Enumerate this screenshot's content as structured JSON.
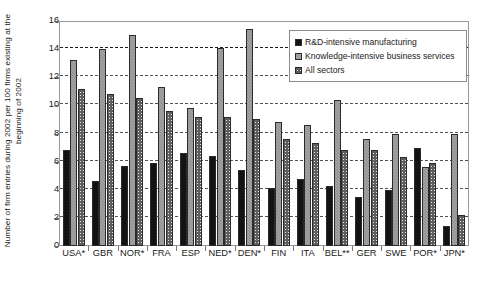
{
  "chart_data": {
    "type": "bar",
    "title": "",
    "subtitle": "",
    "xlabel": "",
    "ylabel": "Number of firm entries during 2002 per 100 firms existing at the beginning of 2002",
    "ylabel_lines": [
      "Number of firm entries during 2002 per 100 firms existing at the",
      "beginning of 2002"
    ],
    "ylim": [
      0,
      16
    ],
    "yticks": [
      0,
      2,
      4,
      6,
      8,
      10,
      12,
      14,
      16
    ],
    "ytick_labels": [
      "0",
      "2",
      "4",
      "6",
      "8",
      "10",
      "12",
      "14",
      "16"
    ],
    "grid": true,
    "grid_axis": "y",
    "legend_position": "top-right",
    "categories": [
      "USA*",
      "GBR",
      "NOR*",
      "FRA",
      "ESP",
      "NED*",
      "DEN*",
      "FIN",
      "ITA",
      "BEL**",
      "GER",
      "SWE",
      "POR*",
      "JPN*"
    ],
    "series": [
      {
        "name": "R&D-intensive manufacturing",
        "color": "#131313",
        "pattern": "solid-black",
        "values": [
          6.8,
          4.6,
          5.7,
          5.9,
          6.6,
          6.4,
          5.4,
          4.1,
          4.8,
          4.3,
          3.5,
          4.0,
          7.0,
          1.4
        ]
      },
      {
        "name": "Knowledge-intensive business services",
        "color": "#8c8c8c",
        "pattern": "solid-gray",
        "values": [
          13.2,
          14.0,
          15.0,
          11.3,
          9.8,
          14.1,
          15.4,
          8.8,
          8.6,
          10.4,
          7.6,
          8.0,
          5.6,
          8.0
        ]
      },
      {
        "name": "All sectors",
        "color": "#e9e9e9",
        "pattern": "cross-hatch",
        "values": [
          11.2,
          10.8,
          10.5,
          9.6,
          9.2,
          9.2,
          9.0,
          7.6,
          7.3,
          6.8,
          6.8,
          6.3,
          5.9,
          2.2
        ]
      }
    ]
  },
  "legend": {
    "items": [
      {
        "label": "R&D-intensive manufacturing"
      },
      {
        "label": "Knowledge-intensive business services"
      },
      {
        "label": "All sectors"
      }
    ]
  }
}
